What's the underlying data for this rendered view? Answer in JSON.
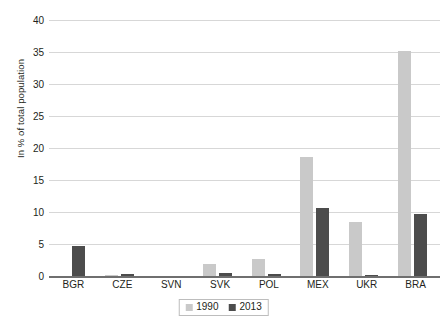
{
  "chart_data": {
    "type": "bar",
    "title": "",
    "subtitle": "",
    "xlabel": "",
    "ylabel": "In % of total population",
    "ylim": [
      0,
      40
    ],
    "yticks": [
      0,
      5,
      10,
      15,
      20,
      25,
      30,
      35,
      40
    ],
    "grid": true,
    "legend_position": "bottom-center",
    "categories": [
      "BGR",
      "CZE",
      "SVN",
      "SVK",
      "POL",
      "MEX",
      "UKR",
      "BRA"
    ],
    "series": [
      {
        "name": "1990",
        "color": "#c9c9c9",
        "values": [
          0,
          0.1,
          0,
          1.9,
          2.7,
          18.6,
          8.5,
          35.2
        ]
      },
      {
        "name": "2013",
        "color": "#4c4c4c",
        "values": [
          4.7,
          0.3,
          0,
          0.5,
          0.3,
          10.6,
          0.2,
          9.7
        ]
      }
    ],
    "annotations": []
  },
  "axis": {
    "y_title": "In % of total population",
    "tick_labels": [
      "0",
      "5",
      "10",
      "15",
      "20",
      "25",
      "30",
      "35",
      "40"
    ],
    "category_labels": [
      "BGR",
      "CZE",
      "SVN",
      "SVK",
      "POL",
      "MEX",
      "UKR",
      "BRA"
    ]
  },
  "legend": {
    "entries": [
      {
        "label": "1990",
        "color": "#c9c9c9"
      },
      {
        "label": "2013",
        "color": "#4c4c4c"
      }
    ]
  },
  "colors": {
    "series_1990": "#c9c9c9",
    "series_2013": "#4c4c4c",
    "gridline": "#d7d7d7",
    "axis": "#6f6f6f",
    "text": "#231f20",
    "background": "#ffffff"
  }
}
